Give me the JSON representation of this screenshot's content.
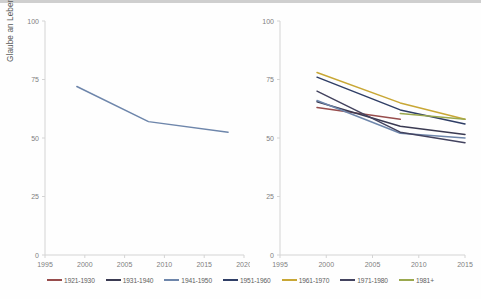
{
  "figure": {
    "ylabel": "Glaube an Leben nach dem Tod (Prozent)",
    "background": "#fefefe"
  },
  "legend": {
    "items": [
      {
        "label": "1921-1930",
        "color": "#974c4c"
      },
      {
        "label": "1931-1940",
        "color": "#3a3a52"
      },
      {
        "label": "1941-1950",
        "color": "#6e86ab"
      },
      {
        "label": "1951-1960",
        "color": "#2f3e66"
      },
      {
        "label": "1961-1970",
        "color": "#c8a735"
      },
      {
        "label": "1971-1980",
        "color": "#43435f"
      },
      {
        "label": "1981+",
        "color": "#9aa84e"
      }
    ]
  },
  "chart_data": [
    {
      "id": "left",
      "type": "line",
      "title": "",
      "xlabel": "",
      "ylabel": "Glaube an Leben nach dem Tod (Prozent)",
      "xlim": [
        1995,
        2020
      ],
      "ylim": [
        0,
        100
      ],
      "xticks": [
        1995,
        2000,
        2005,
        2010,
        2015,
        2020
      ],
      "yticks": [
        0,
        25,
        50,
        75,
        100
      ],
      "grid": false,
      "legend_position": "bottom",
      "series": [
        {
          "name": "1941-1950",
          "color": "#6e86ab",
          "x": [
            1999,
            2008,
            2018
          ],
          "values": [
            72,
            57,
            52.5
          ]
        }
      ]
    },
    {
      "id": "right",
      "type": "line",
      "title": "",
      "xlabel": "",
      "ylabel": "",
      "xlim": [
        1995,
        2015
      ],
      "ylim": [
        0,
        100
      ],
      "xticks": [
        1995,
        2000,
        2005,
        2010,
        2015
      ],
      "yticks": [
        0,
        25,
        50,
        75,
        100
      ],
      "grid": false,
      "legend_position": "bottom",
      "series": [
        {
          "name": "1921-1930",
          "color": "#974c4c",
          "x": [
            1999,
            2008
          ],
          "values": [
            63,
            58
          ]
        },
        {
          "name": "1931-1940",
          "color": "#3a3a52",
          "x": [
            1999,
            2008,
            2015
          ],
          "values": [
            65.5,
            55,
            51.5
          ]
        },
        {
          "name": "1941-1950",
          "color": "#6e86ab",
          "x": [
            1999,
            2008,
            2015
          ],
          "values": [
            66,
            52,
            50
          ]
        },
        {
          "name": "1951-1960",
          "color": "#2f3e66",
          "x": [
            1999,
            2008,
            2015
          ],
          "values": [
            76,
            62,
            56
          ]
        },
        {
          "name": "1961-1970",
          "color": "#c8a735",
          "x": [
            1999,
            2008,
            2015
          ],
          "values": [
            78,
            65,
            58
          ]
        },
        {
          "name": "1971-1980",
          "color": "#43435f",
          "x": [
            1999,
            2008,
            2015
          ],
          "values": [
            70,
            52.5,
            48
          ]
        },
        {
          "name": "1981+",
          "color": "#9aa84e",
          "x": [
            2008,
            2015
          ],
          "values": [
            60.5,
            58
          ]
        }
      ]
    }
  ]
}
